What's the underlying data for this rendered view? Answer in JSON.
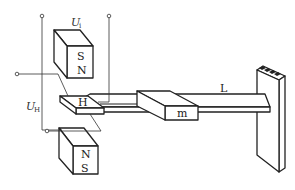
{
  "diagram": {
    "type": "hall-effect-accelerometer-schematic",
    "labels": {
      "input_voltage": "U",
      "input_voltage_sub": "i",
      "hall_voltage": "U",
      "hall_voltage_sub": "H",
      "hall_element": "H",
      "mass": "m",
      "beam_length": "L"
    },
    "magnets": {
      "top": {
        "pole_front_upper": "S",
        "pole_front_lower": "N"
      },
      "bottom": {
        "pole_front_upper": "N",
        "pole_front_lower": "S"
      }
    },
    "colors": {
      "stroke": "#222222",
      "background": "#ffffff"
    }
  }
}
